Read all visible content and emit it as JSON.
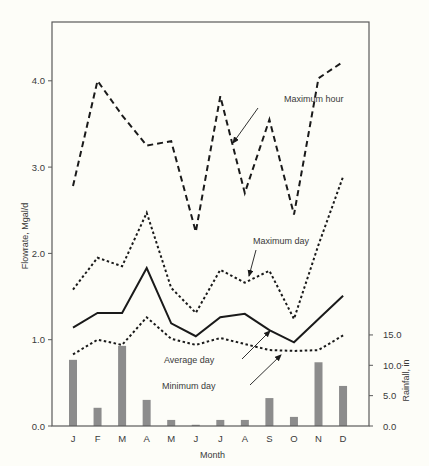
{
  "chart_data": {
    "type": "line",
    "title": "",
    "xlabel": "Month",
    "ylabel": "Flowrate, Mgal/d",
    "y2label": "Rainfall, in",
    "categories": [
      "J",
      "F",
      "M",
      "A",
      "M",
      "J",
      "J",
      "A",
      "S",
      "O",
      "N",
      "D"
    ],
    "ylim": [
      0,
      4.5
    ],
    "yticks": [
      "0.0",
      "1.0",
      "2.0",
      "3.0",
      "4.0"
    ],
    "y2lim": [
      0,
      15.0
    ],
    "y2ticks": [
      "0.0",
      "5.0",
      "10.0",
      "15.0"
    ],
    "grid": false,
    "legend": "inline annotations with arrows",
    "series": [
      {
        "name": "Maximum hour",
        "style": "dashed",
        "axis": "left",
        "values": [
          2.78,
          4.0,
          3.6,
          3.25,
          3.3,
          2.25,
          3.82,
          2.7,
          3.55,
          2.45,
          4.03,
          4.22
        ]
      },
      {
        "name": "Maximum day",
        "style": "dotted",
        "axis": "left",
        "values": [
          1.58,
          1.95,
          1.85,
          2.47,
          1.6,
          1.31,
          1.81,
          1.66,
          1.8,
          1.24,
          2.1,
          2.89
        ]
      },
      {
        "name": "Average day",
        "style": "solid",
        "axis": "left",
        "values": [
          1.14,
          1.31,
          1.31,
          1.83,
          1.19,
          1.04,
          1.26,
          1.3,
          1.11,
          0.97,
          1.24,
          1.51
        ]
      },
      {
        "name": "Minimum day",
        "style": "dotted",
        "axis": "left",
        "values": [
          0.83,
          1.0,
          0.94,
          1.26,
          1.01,
          0.94,
          1.02,
          0.95,
          0.88,
          0.87,
          0.88,
          1.05
        ]
      },
      {
        "name": "Rainfall",
        "type": "bar",
        "axis": "right",
        "color": "#8c8c8c",
        "values": [
          10.9,
          3.0,
          13.2,
          4.3,
          1.0,
          0.2,
          1.0,
          1.0,
          4.6,
          1.5,
          10.5,
          6.6
        ]
      }
    ],
    "annotations": [
      {
        "text": "Maximum hour",
        "x": 284,
        "y": 102,
        "arrow_from": [
          258,
          108
        ],
        "arrow_to": [
          233,
          143
        ]
      },
      {
        "text": "Maximum day",
        "x": 253,
        "y": 244,
        "arrow_from": [
          256,
          250
        ],
        "arrow_to": [
          249,
          276
        ]
      },
      {
        "text": "Average day",
        "x": 164,
        "y": 363,
        "arrow_from": [
          242,
          359
        ],
        "arrow_to": [
          270,
          331
        ]
      },
      {
        "text": "Minimum day",
        "x": 162,
        "y": 389,
        "arrow_from": [
          250,
          385
        ],
        "arrow_to": [
          281,
          355
        ]
      }
    ]
  },
  "layout": {
    "plot": {
      "left": 52,
      "top": 22,
      "right": 369,
      "bottom": 426
    },
    "x_start": 73,
    "x_step": 24.55,
    "y_px_per_unit": 86.3,
    "y2_px_per_unit": 6.07
  }
}
